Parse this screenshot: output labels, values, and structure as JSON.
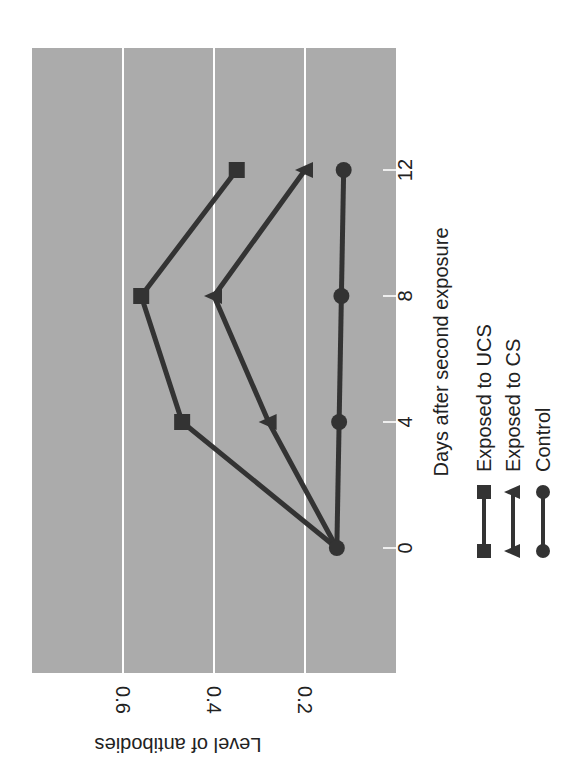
{
  "chart_data": {
    "type": "line",
    "title": "",
    "orientation_note": "figure is rotated 90 degrees clockwise on the page",
    "xlabel": "Days after second exposure",
    "ylabel": "Level of antibodies",
    "x": [
      0,
      4,
      8,
      12
    ],
    "x_ticks": [
      "0",
      "4",
      "8",
      "12"
    ],
    "y_ticks": [
      "0.2",
      "0.4",
      "0.6"
    ],
    "y_tick_values": [
      0.2,
      0.4,
      0.6
    ],
    "ylim": [
      0.0,
      0.8
    ],
    "xlim": [
      -3.9,
      16.3
    ],
    "grid": "horizontal gridlines at y ticks (white)",
    "legend_position": "below x-axis label",
    "series": [
      {
        "name": "Exposed to UCS",
        "marker": "square",
        "values": [
          0.13,
          0.47,
          0.56,
          0.35
        ]
      },
      {
        "name": "Exposed to CS",
        "marker": "triangle",
        "values": [
          0.13,
          0.28,
          0.4,
          0.2
        ]
      },
      {
        "name": "Control",
        "marker": "circle",
        "values": [
          0.13,
          0.125,
          0.12,
          0.115
        ]
      }
    ]
  },
  "legend": {
    "items": [
      {
        "label": "Exposed to UCS",
        "marker": "square"
      },
      {
        "label": "Exposed to CS",
        "marker": "triangle"
      },
      {
        "label": "Control",
        "marker": "circle"
      }
    ]
  },
  "colors": {
    "plot_background": "#ababab",
    "gridline": "#ffffff",
    "series_line": "#333333",
    "text": "#222222"
  }
}
